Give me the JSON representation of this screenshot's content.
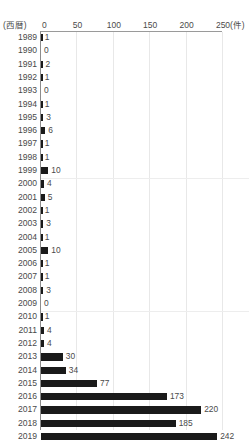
{
  "chart_data": {
    "type": "bar",
    "orientation": "horizontal",
    "title": "",
    "xlabel": "(件)",
    "ylabel": "(西暦)",
    "xlim": [
      0,
      250
    ],
    "xticks": [
      0,
      50,
      100,
      150,
      200,
      250
    ],
    "xtick_labels": [
      "0",
      "50",
      "100",
      "150",
      "200",
      "250"
    ],
    "grid": "vertical",
    "legend": "none",
    "categories": [
      "1989",
      "1990",
      "1991",
      "1992",
      "1993",
      "1994",
      "1995",
      "1996",
      "1997",
      "1998",
      "1999",
      "2000",
      "2001",
      "2002",
      "2003",
      "2004",
      "2005",
      "2006",
      "2007",
      "2008",
      "2009",
      "2010",
      "2011",
      "2012",
      "2013",
      "2014",
      "2015",
      "2016",
      "2017",
      "2018",
      "2019"
    ],
    "values": [
      1,
      0,
      2,
      1,
      0,
      1,
      3,
      6,
      1,
      1,
      10,
      4,
      5,
      1,
      3,
      1,
      10,
      1,
      1,
      3,
      0,
      1,
      4,
      4,
      30,
      34,
      77,
      173,
      220,
      185,
      242
    ]
  },
  "axis": {
    "corner_label": "(西暦)",
    "unit_label": "(件)",
    "ticks": [
      {
        "label": "0",
        "value": 0
      },
      {
        "label": "50",
        "value": 50
      },
      {
        "label": "100",
        "value": 100
      },
      {
        "label": "150",
        "value": 150
      },
      {
        "label": "200",
        "value": 200
      },
      {
        "label": "250",
        "value": 250
      }
    ]
  },
  "rows": [
    {
      "year": "1989",
      "value": 1,
      "label": "1"
    },
    {
      "year": "1990",
      "value": 0,
      "label": "0"
    },
    {
      "year": "1991",
      "value": 2,
      "label": "2"
    },
    {
      "year": "1992",
      "value": 1,
      "label": "1"
    },
    {
      "year": "1993",
      "value": 0,
      "label": "0"
    },
    {
      "year": "1994",
      "value": 1,
      "label": "1"
    },
    {
      "year": "1995",
      "value": 3,
      "label": "3"
    },
    {
      "year": "1996",
      "value": 6,
      "label": "6"
    },
    {
      "year": "1997",
      "value": 1,
      "label": "1"
    },
    {
      "year": "1998",
      "value": 1,
      "label": "1"
    },
    {
      "year": "1999",
      "value": 10,
      "label": "10"
    },
    {
      "year": "2000",
      "value": 4,
      "label": "4"
    },
    {
      "year": "2001",
      "value": 5,
      "label": "5"
    },
    {
      "year": "2002",
      "value": 1,
      "label": "1"
    },
    {
      "year": "2003",
      "value": 3,
      "label": "3"
    },
    {
      "year": "2004",
      "value": 1,
      "label": "1"
    },
    {
      "year": "2005",
      "value": 10,
      "label": "10"
    },
    {
      "year": "2006",
      "value": 1,
      "label": "1"
    },
    {
      "year": "2007",
      "value": 1,
      "label": "1"
    },
    {
      "year": "2008",
      "value": 3,
      "label": "3"
    },
    {
      "year": "2009",
      "value": 0,
      "label": "0"
    },
    {
      "year": "2010",
      "value": 1,
      "label": "1"
    },
    {
      "year": "2011",
      "value": 4,
      "label": "4"
    },
    {
      "year": "2012",
      "value": 4,
      "label": "4"
    },
    {
      "year": "2013",
      "value": 30,
      "label": "30"
    },
    {
      "year": "2014",
      "value": 34,
      "label": "34"
    },
    {
      "year": "2015",
      "value": 77,
      "label": "77"
    },
    {
      "year": "2016",
      "value": 173,
      "label": "173"
    },
    {
      "year": "2017",
      "value": 220,
      "label": "220"
    },
    {
      "year": "2018",
      "value": 185,
      "label": "185"
    },
    {
      "year": "2019",
      "value": 242,
      "label": "242"
    }
  ],
  "colors": {
    "bar": "#1a1a1a",
    "grid": "#e8e8e8",
    "axis": "#8c8c8c",
    "text": "#4a4a4a",
    "background": "#ffffff"
  }
}
